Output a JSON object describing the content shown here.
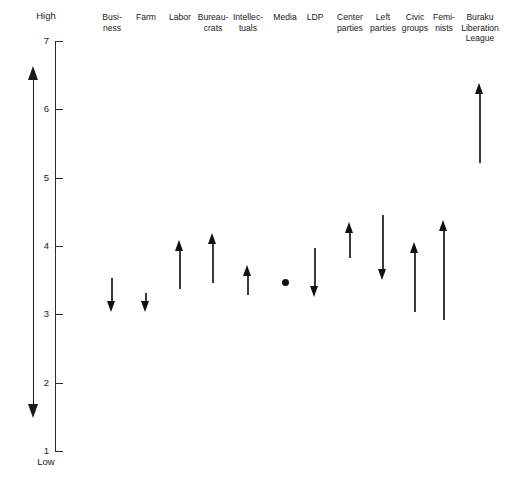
{
  "chart_data": {
    "type": "bar",
    "title": "",
    "subtitle": "",
    "xlabel": "",
    "ylabel": "Scale of influence",
    "ylim": [
      1,
      7
    ],
    "yticks": [
      1,
      2,
      3,
      4,
      5,
      6,
      7
    ],
    "ytick_labels": [
      "1",
      "2",
      "3",
      "4",
      "5",
      "6",
      "7"
    ],
    "axis_high_caption": "High",
    "axis_low_caption": "Low",
    "grid": false,
    "legend": "none",
    "categories": [
      "Business",
      "Farm",
      "Labor",
      "Bureaucrats",
      "Intellectuals",
      "Media",
      "LDP",
      "Center parties",
      "Left parties",
      "Civic groups",
      "Feminists",
      "Buraku Liberation League"
    ],
    "category_label_lines": [
      "Busi-\nness",
      "Farm",
      "Labor",
      "Bureau-\ncrats",
      "Intellec-\ntuals",
      "Media",
      "LDP",
      "Center\nparties",
      "Left\nparties",
      "Civic\ngroups",
      "Femi-\nnists",
      "Buraku\nLiberation\nLeague"
    ],
    "series": [
      {
        "name": "start",
        "values": [
          3.53,
          3.31,
          3.37,
          3.46,
          3.28,
          3.46,
          3.97,
          3.82,
          4.45,
          3.03,
          2.92,
          5.21
        ]
      },
      {
        "name": "end",
        "values": [
          3.03,
          3.03,
          4.09,
          4.19,
          3.72,
          3.46,
          3.25,
          4.35,
          3.5,
          4.06,
          4.38,
          6.38
        ]
      }
    ],
    "directions": [
      "down",
      "down",
      "up",
      "up",
      "up",
      "none",
      "down",
      "up",
      "down",
      "up",
      "up",
      "up"
    ]
  },
  "layout": {
    "x_positions": [
      112,
      146,
      180,
      213,
      248,
      285,
      315,
      350,
      383,
      415,
      444,
      480
    ],
    "axis_x": 55,
    "plot_top_y": 41,
    "plot_bottom_y": 451
  }
}
